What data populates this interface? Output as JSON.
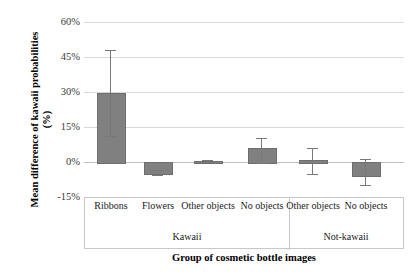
{
  "chart_data": {
    "type": "bar",
    "title": "",
    "xlabel": "Group of cosmetic bottle images",
    "ylabel": "Mean difference of kawaii probabilities (%)",
    "ylabel_line1": "Mean difference of kawaii probabilities",
    "ylabel_line2": "(%)",
    "ylim": [
      -15,
      60
    ],
    "yticks": [
      "60%",
      "45%",
      "30%",
      "15%",
      "0%",
      "-15%"
    ],
    "ytick_values": [
      60,
      45,
      30,
      15,
      0,
      -15
    ],
    "grid": true,
    "legend": "none",
    "categories": [
      "Ribbons",
      "Flowers",
      "Other objects",
      "No objects",
      "Other objects",
      "No objects"
    ],
    "groups": [
      {
        "label": "Kawaii",
        "categories": [
          "Ribbons",
          "Flowers",
          "Other objects",
          "No objects"
        ]
      },
      {
        "label": "Not-kawaii",
        "categories": [
          "Other objects",
          "No objects"
        ]
      }
    ],
    "values": [
      29.5,
      -4.5,
      0.4,
      6.0,
      1.0,
      -5.5
    ],
    "error_low": [
      11.0,
      -5.5,
      -0.2,
      -0.5,
      -5.0,
      -10.0
    ],
    "error_high": [
      48.0,
      -3.5,
      1.0,
      10.5,
      6.0,
      1.5
    ],
    "bar_color": "#808080",
    "grid_color": "#d9d9d9",
    "error_color": "#787878"
  }
}
